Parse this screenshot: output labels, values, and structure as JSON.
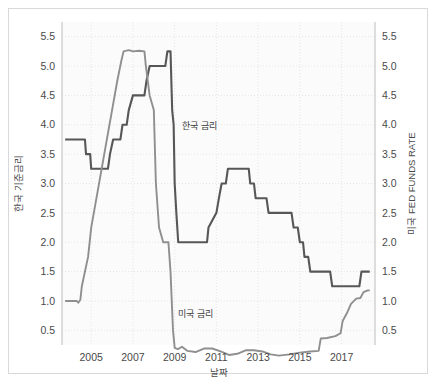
{
  "chart_data": {
    "type": "line",
    "title": "",
    "xlabel": "날짜",
    "ylabel": "한국 기준금리",
    "y2label": "미국 FED FUNDS RATE",
    "xlim": [
      2003.6,
      2018.6
    ],
    "ylim": [
      0.25,
      5.75
    ],
    "y2lim": [
      0.25,
      5.75
    ],
    "grid": true,
    "legend_position": "inline-annotations",
    "xticks": [
      "2005",
      "2007",
      "2009",
      "2011",
      "2013",
      "2015",
      "2017"
    ],
    "xtick_values": [
      2005,
      2007,
      2009,
      2011,
      2013,
      2015,
      2017
    ],
    "yticks": [
      "0.5",
      "1.0",
      "1.5",
      "2.0",
      "2.5",
      "3.0",
      "3.5",
      "4.0",
      "4.5",
      "5.0",
      "5.5"
    ],
    "ytick_values": [
      0.5,
      1.0,
      1.5,
      2.0,
      2.5,
      3.0,
      3.5,
      4.0,
      4.5,
      5.0,
      5.5
    ],
    "y2ticks": [
      "0.5",
      "1.0",
      "1.5",
      "2.0",
      "2.5",
      "3.0",
      "3.5",
      "4.0",
      "4.5",
      "5.0",
      "5.5"
    ],
    "y2tick_values": [
      0.5,
      1.0,
      1.5,
      2.0,
      2.5,
      3.0,
      3.5,
      4.0,
      4.5,
      5.0,
      5.5
    ],
    "colors": {
      "korea": "#575757",
      "us": "#8f8f8f",
      "grid": "#dcdcdc",
      "spine": "#bdbdbd",
      "plot_bg": "#fbfbfb",
      "text": "#4a4a4a"
    },
    "annotations": [
      {
        "name": "korea-series-label",
        "text": "한국 금리",
        "x": 2010.2,
        "y": 3.92
      },
      {
        "name": "us-series-label",
        "text": "미국 금리",
        "x": 2010.0,
        "y": 0.72
      }
    ],
    "series": [
      {
        "name": "한국 금리",
        "axis": "left",
        "color": "#575757",
        "points": [
          [
            2003.75,
            3.75
          ],
          [
            2004.7,
            3.75
          ],
          [
            2004.75,
            3.5
          ],
          [
            2004.95,
            3.5
          ],
          [
            2005.0,
            3.25
          ],
          [
            2005.8,
            3.25
          ],
          [
            2005.9,
            3.5
          ],
          [
            2006.05,
            3.75
          ],
          [
            2006.4,
            3.75
          ],
          [
            2006.5,
            4.0
          ],
          [
            2006.7,
            4.0
          ],
          [
            2006.8,
            4.25
          ],
          [
            2007.0,
            4.5
          ],
          [
            2007.55,
            4.5
          ],
          [
            2007.65,
            4.75
          ],
          [
            2007.8,
            5.0
          ],
          [
            2008.55,
            5.0
          ],
          [
            2008.65,
            5.25
          ],
          [
            2008.8,
            5.25
          ],
          [
            2008.88,
            4.25
          ],
          [
            2008.95,
            4.0
          ],
          [
            2009.0,
            3.0
          ],
          [
            2009.08,
            2.5
          ],
          [
            2009.17,
            2.0
          ],
          [
            2010.55,
            2.0
          ],
          [
            2010.62,
            2.25
          ],
          [
            2011.0,
            2.5
          ],
          [
            2011.12,
            2.75
          ],
          [
            2011.25,
            3.0
          ],
          [
            2011.45,
            3.0
          ],
          [
            2011.55,
            3.25
          ],
          [
            2012.55,
            3.25
          ],
          [
            2012.62,
            3.0
          ],
          [
            2012.8,
            3.0
          ],
          [
            2012.88,
            2.75
          ],
          [
            2013.4,
            2.75
          ],
          [
            2013.5,
            2.5
          ],
          [
            2014.6,
            2.5
          ],
          [
            2014.7,
            2.25
          ],
          [
            2014.9,
            2.25
          ],
          [
            2015.0,
            2.0
          ],
          [
            2015.15,
            2.0
          ],
          [
            2015.22,
            1.75
          ],
          [
            2015.4,
            1.75
          ],
          [
            2015.5,
            1.5
          ],
          [
            2016.45,
            1.5
          ],
          [
            2016.55,
            1.25
          ],
          [
            2017.85,
            1.25
          ],
          [
            2017.95,
            1.5
          ],
          [
            2018.35,
            1.5
          ]
        ]
      },
      {
        "name": "미국 금리",
        "axis": "right",
        "color": "#8f8f8f",
        "points": [
          [
            2003.75,
            1.0
          ],
          [
            2004.3,
            1.0
          ],
          [
            2004.38,
            0.97
          ],
          [
            2004.48,
            1.02
          ],
          [
            2004.55,
            1.25
          ],
          [
            2004.7,
            1.5
          ],
          [
            2004.85,
            1.75
          ],
          [
            2005.0,
            2.25
          ],
          [
            2005.25,
            2.75
          ],
          [
            2005.5,
            3.25
          ],
          [
            2005.75,
            3.75
          ],
          [
            2006.0,
            4.25
          ],
          [
            2006.25,
            4.75
          ],
          [
            2006.45,
            5.1
          ],
          [
            2006.55,
            5.25
          ],
          [
            2006.8,
            5.27
          ],
          [
            2007.0,
            5.25
          ],
          [
            2007.3,
            5.26
          ],
          [
            2007.55,
            5.25
          ],
          [
            2007.62,
            5.0
          ],
          [
            2007.8,
            4.5
          ],
          [
            2008.0,
            4.25
          ],
          [
            2008.1,
            3.0
          ],
          [
            2008.25,
            2.25
          ],
          [
            2008.45,
            2.0
          ],
          [
            2008.7,
            2.0
          ],
          [
            2008.8,
            1.5
          ],
          [
            2008.92,
            0.5
          ],
          [
            2009.0,
            0.2
          ],
          [
            2009.15,
            0.18
          ],
          [
            2009.35,
            0.22
          ],
          [
            2009.6,
            0.15
          ],
          [
            2010.0,
            0.13
          ],
          [
            2010.4,
            0.19
          ],
          [
            2010.8,
            0.19
          ],
          [
            2011.2,
            0.14
          ],
          [
            2011.6,
            0.08
          ],
          [
            2012.0,
            0.1
          ],
          [
            2012.4,
            0.16
          ],
          [
            2012.8,
            0.16
          ],
          [
            2013.2,
            0.14
          ],
          [
            2013.6,
            0.09
          ],
          [
            2014.0,
            0.07
          ],
          [
            2014.5,
            0.09
          ],
          [
            2015.0,
            0.12
          ],
          [
            2015.5,
            0.14
          ],
          [
            2015.9,
            0.15
          ],
          [
            2016.0,
            0.36
          ],
          [
            2016.3,
            0.37
          ],
          [
            2016.7,
            0.4
          ],
          [
            2016.95,
            0.45
          ],
          [
            2017.05,
            0.66
          ],
          [
            2017.25,
            0.79
          ],
          [
            2017.45,
            0.95
          ],
          [
            2017.7,
            1.04
          ],
          [
            2017.9,
            1.05
          ],
          [
            2018.05,
            1.15
          ],
          [
            2018.25,
            1.18
          ],
          [
            2018.35,
            1.18
          ]
        ]
      }
    ]
  }
}
